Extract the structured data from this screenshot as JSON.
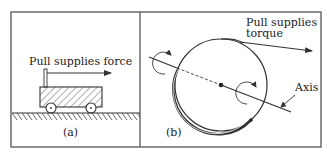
{
  "panel_a": {
    "force_label": "Pull supplies force",
    "caption": "(a)"
  },
  "panel_b": {
    "torque_label_line1": "Pull supplies",
    "torque_label_line2": "torque",
    "axis_label": "Axis",
    "caption": "(b)"
  },
  "colors": {
    "stroke": "#2a2a2a",
    "frame": "#555555"
  }
}
